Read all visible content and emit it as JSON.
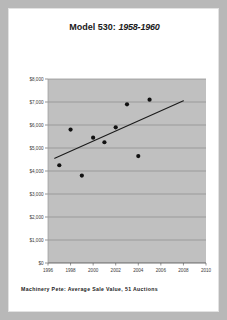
{
  "card": {
    "title_model": "Model 530:",
    "title_years": "1958-1960",
    "footer": "Machinery Pete: Average Sale Value, 51 Auctions"
  },
  "chart_data": {
    "type": "scatter",
    "title": "Model 530:  1958-1960",
    "xlabel": "",
    "ylabel": "",
    "xlim": [
      1996,
      2010
    ],
    "ylim": [
      0,
      8000
    ],
    "grid": true,
    "legend": "none",
    "xticks": [
      "1996",
      "1998",
      "2000",
      "2002",
      "2004",
      "2006",
      "2008",
      "2010"
    ],
    "xtick_values": [
      1996,
      1998,
      2000,
      2002,
      2004,
      2006,
      2008,
      2010
    ],
    "yticks": [
      "$0",
      "$1,000",
      "$2,000",
      "$3,000",
      "$4,000",
      "$5,000",
      "$6,000",
      "$7,000",
      "$8,000"
    ],
    "ytick_values": [
      0,
      1000,
      2000,
      3000,
      4000,
      5000,
      6000,
      7000,
      8000
    ],
    "points": [
      {
        "x": 1997.0,
        "y": 4250
      },
      {
        "x": 1998.0,
        "y": 5800
      },
      {
        "x": 1999.0,
        "y": 3800
      },
      {
        "x": 2000.0,
        "y": 5450
      },
      {
        "x": 2001.0,
        "y": 5250
      },
      {
        "x": 2002.0,
        "y": 5900
      },
      {
        "x": 2003.0,
        "y": 6900
      },
      {
        "x": 2004.0,
        "y": 4650
      },
      {
        "x": 2005.0,
        "y": 7100
      }
    ],
    "trendline": {
      "x_start": 1996.6,
      "y_start": 4550,
      "x_end": 2008.0,
      "y_end": 7050
    },
    "marker_color": "#111111",
    "plot_bg_color": "#c0c0c0",
    "gridline_color": "#8a8a8a",
    "trendline_color": "#1a1a1a"
  }
}
